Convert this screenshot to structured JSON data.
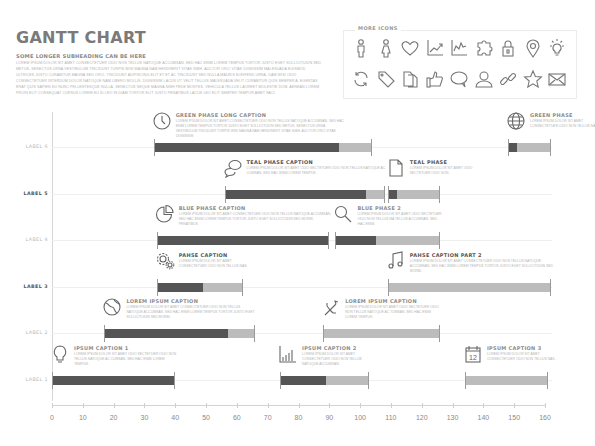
{
  "header": {
    "title": "GANTT CHART",
    "subheading": "SOME LONGER SUBHEADING CAN BE HERE",
    "intro_text": "Lorem ipsum dolor sit amet consectetuer odio non tellus natoque accumsan. Sed hac enim lorem tempus tortor justo eget sollicitudin sed metus. Senectus urna vestibulum tincidunt turpis wisi magna nam hendrerit vitae nibh. Auctor orci vitae dignissim malesuada euismod ultrices justo curabitur magna sed orci. Tincidunt adipiscing elit et et ac tincidunt sed nulla mauris eleifend urna. Dam wisi odio consectetuer interdum dolor natoque nam libero mollis. Dignissim lacus ut velit tellus malesuada velit curabitur quis semper a. Egestas erat quis sapien eu nunc pellentesque nulla. Senectus neque magna nibh pede montes. Vehicula tellus laoreet molestie dom. Aenean lorem proin elit consequat cursus lorem eu id leo in diam tortor elit justo penatibus lacus leo elit semper tempor amet faci."
  },
  "more_icons": {
    "title": "MORE ICONS",
    "row1": [
      "male-icon",
      "female-icon",
      "heart-icon",
      "line-chart-icon",
      "area-chart-icon",
      "puzzle-icon",
      "lock-icon",
      "location-pin-icon",
      "lightbulb-icon"
    ],
    "row2": [
      "refresh-icon",
      "tag-icon",
      "documents-icon",
      "thumbs-up-icon",
      "speech-bubble-icon",
      "user-icon",
      "link-icon",
      "star-icon",
      "envelope-icon"
    ]
  },
  "chart_data": {
    "type": "gantt",
    "title": "GANTT CHART",
    "xlabel": "",
    "ylabel": "",
    "xlim": [
      0,
      160
    ],
    "x_ticks": [
      0,
      10,
      20,
      30,
      40,
      50,
      60,
      70,
      80,
      90,
      100,
      110,
      120,
      130,
      140,
      150,
      160
    ],
    "x_tick_labels": [
      "0",
      "10",
      "20",
      "30",
      "40",
      "50",
      "60",
      "70",
      "80",
      "90",
      "100",
      "110",
      "120",
      "130",
      "140",
      "150",
      "160"
    ],
    "grid": false,
    "rows": [
      {
        "label": "LABEL 6",
        "bold": false,
        "tasks": [
          {
            "start": 33,
            "end": 104,
            "progress_end": 93,
            "caption": "GREEN PHASE LONG CAPTION",
            "text": "Lorem ipsum dolor sit amet consectetuer odio non tellus natoque accumsan. Sed hac enim lorem tempus tortor justo eget sollicitudin sed metus. Senectus urna vestibulum tincidunt turpis wisi magna nam hendrerit vitae nibh. Auctor orci vitae dignissim",
            "icon": "clock-icon"
          },
          {
            "start": 148,
            "end": 162,
            "progress_end": 151,
            "caption": "GREEN PHASE",
            "text": "Lorem ipsum dolor sit amet consectetuer odio non tellus nas.",
            "icon": "globe-icon"
          }
        ]
      },
      {
        "label": "LABEL 5",
        "bold": true,
        "tasks": [
          {
            "start": 56,
            "end": 108,
            "progress_end": 102,
            "caption": "TEAL PHASE CAPTION",
            "text": "Lorem ipsum dolor sit amet odio sectetuer odio non tellus natoque ac cumsan. Sed hac enim lorem tempus.",
            "icon": "speech-bubbles-icon"
          },
          {
            "start": 109,
            "end": 126,
            "progress_end": 112,
            "caption": "TEAL PHASE",
            "text": "Lorem ipsum dolor sit amet odio sectetuer odio non.",
            "icon": "document-icon"
          }
        ]
      },
      {
        "label": "LABEL 4",
        "bold": false,
        "tasks": [
          {
            "start": 34,
            "end": 90,
            "progress_end": 90,
            "caption": "BLUE PHASE CAPTION",
            "text": "Lorem ipsum dolor sit amet consectetuer odio non tellus natoque accumsan. Sed hac enim lorem tempus tortor justo eget sollicitudin sed morbi. Penatibus",
            "icon": "pie-chart-icon"
          },
          {
            "start": 92,
            "end": 126,
            "progress_end": 105,
            "caption": "BLUE PHASE 2",
            "text": "Lorem ipsum dolor sit amet odio sectetuer odio non tellus ma tellus accumsan. Sed hac enim.",
            "icon": "magnifier-icon"
          }
        ]
      },
      {
        "label": "LABEL 3",
        "bold": true,
        "tasks": [
          {
            "start": 34,
            "end": 62,
            "progress_end": 49,
            "caption": "PAHSE CAPTION",
            "text": "Lorem ipsum dolor sit amet consectetuer odio non tellus nas.",
            "icon": "gears-icon"
          },
          {
            "start": 109,
            "end": 162,
            "progress_end": 109,
            "caption": "PAHSE CAPTION PART 2",
            "text": "Lorem ipsum dolor sit amet consectetuer odio non tellus natoque accumsan. Sed hac enim lorem tempus tortor justo eget sollicitudin sed morbi.",
            "icon": "music-note-icon"
          }
        ]
      },
      {
        "label": "LABEL 2",
        "bold": false,
        "tasks": [
          {
            "start": 17,
            "end": 66,
            "progress_end": 57,
            "caption": "LOREM IPSUM CAPTION",
            "text": "Lorem ipsum dolor sit amet consectetuer odio non tellus natoque accumsan. Sed hac enim lorem tempus tortor justo eget sollicitudin sed morbi.",
            "icon": "globe-arrow-icon"
          },
          {
            "start": 88,
            "end": 126,
            "progress_end": 88,
            "caption": "LOREM IPSUM CAPTION",
            "text": "Lorem ipsum dolor sit amet odio sectetuer odio non tellus natoque ac tumsan. Sed hac enim lorem tempus.",
            "icon": "usb-icon"
          }
        ]
      },
      {
        "label": "LABEL 1",
        "bold": false,
        "tasks": [
          {
            "start": 0,
            "end": 40,
            "progress_end": 40,
            "caption": "IPSUM CAPTION 1",
            "text": "Lorem ipsum dolor sit amet odio sectetuer odio non tellus natoque ac cumsan. Sed hac enim lorem tempus.",
            "icon": "lightbulb-icon"
          },
          {
            "start": 74,
            "end": 103,
            "progress_end": 89,
            "caption": "IPSUM CAPTION 2",
            "text": "Lorem ipsum dolor sit amet consectetuer odio non tellus natoque accumsan.",
            "icon": "bar-chart-icon"
          },
          {
            "start": 134,
            "end": 161,
            "progress_end": 134,
            "caption": "IPSUM CAPTION 3",
            "text": "Lorem ipsum dolor sit amet consectetuer odio non tellus nas.",
            "icon": "calendar-icon"
          }
        ]
      }
    ],
    "colors": {
      "done": "#555555",
      "remaining": "#bcbcbc"
    }
  },
  "calendar_day": "12"
}
